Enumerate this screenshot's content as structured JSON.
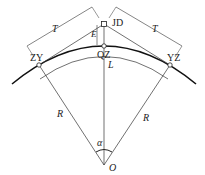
{
  "diagram": {
    "labels": {
      "T_left": "T",
      "T_right": "T",
      "JD": "JD",
      "E": "E",
      "QZ": "QZ",
      "ZY": "ZY",
      "YZ": "YZ",
      "L": "L",
      "R_left": "R",
      "R_right": "R",
      "alpha": "α",
      "O": "O"
    },
    "colors": {
      "line": "#333333",
      "curve": "#111111",
      "background": "#ffffff"
    }
  }
}
